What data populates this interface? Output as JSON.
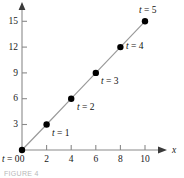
{
  "figure": {
    "caption": "FIGURE 4"
  },
  "chart_data": {
    "type": "scatter",
    "title": "",
    "subtitle": "",
    "xlabel": "x",
    "ylabel": "",
    "xlim": [
      0,
      11
    ],
    "ylim": [
      0,
      16.5
    ],
    "grid": false,
    "legend": null,
    "x_ticks": [
      "0",
      "2",
      "4",
      "6",
      "8",
      "10"
    ],
    "x_tick_values": [
      0,
      2,
      4,
      6,
      8,
      10
    ],
    "y_ticks": [
      "3",
      "6",
      "9",
      "12",
      "15"
    ],
    "y_tick_values": [
      3,
      6,
      9,
      12,
      15
    ],
    "series": [
      {
        "name": "parametric path",
        "line_style": "solid",
        "line_color": "#9a9a9a",
        "marker": "filled-circle",
        "marker_color": "#000000",
        "x": [
          0,
          2,
          4,
          6,
          8,
          10
        ],
        "y": [
          0,
          3,
          6,
          9,
          12,
          15
        ]
      }
    ],
    "annotations": [
      {
        "id": "t0",
        "text": "t = 0",
        "param": "t",
        "value": 0,
        "x": 0,
        "y": 0,
        "placement": "below-left"
      },
      {
        "id": "t1",
        "text": "t = 1",
        "param": "t",
        "value": 1,
        "x": 2,
        "y": 3,
        "placement": "below-right"
      },
      {
        "id": "t2",
        "text": "t = 2",
        "param": "t",
        "value": 2,
        "x": 4,
        "y": 6,
        "placement": "below-right"
      },
      {
        "id": "t3",
        "text": "t = 3",
        "param": "t",
        "value": 3,
        "x": 6,
        "y": 9,
        "placement": "below-right"
      },
      {
        "id": "t4",
        "text": "t = 4",
        "param": "t",
        "value": 4,
        "x": 8,
        "y": 12,
        "placement": "below-right"
      },
      {
        "id": "t5",
        "text": "t = 5",
        "param": "t",
        "value": 5,
        "x": 10,
        "y": 15,
        "placement": "above-left"
      }
    ],
    "annotation_labels": {
      "t0": "t = 0",
      "t1": "t = 1",
      "t2": "t = 2",
      "t3": "t = 3",
      "t4": "t = 4",
      "t5": "t = 5"
    },
    "axes": {
      "x_axis_label": "x",
      "x_axis_arrow": true,
      "y_axis_arrow": true,
      "axis_color": "#7d7d7d"
    }
  }
}
